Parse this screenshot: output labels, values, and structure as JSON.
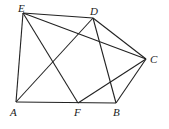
{
  "diagram": {
    "points": [
      {
        "name": "E",
        "x": 23,
        "y": 13,
        "label_x": 18,
        "label_y": 12
      },
      {
        "name": "D",
        "x": 93,
        "y": 18,
        "label_x": 90,
        "label_y": 15
      },
      {
        "name": "C",
        "x": 146,
        "y": 59,
        "label_x": 150,
        "label_y": 63
      },
      {
        "name": "B",
        "x": 116,
        "y": 103,
        "label_x": 113,
        "label_y": 116
      },
      {
        "name": "F",
        "x": 78,
        "y": 103,
        "label_x": 74,
        "label_y": 116
      },
      {
        "name": "A",
        "x": 16,
        "y": 102,
        "label_x": 10,
        "label_y": 116
      }
    ],
    "segments": [
      [
        "E",
        "D"
      ],
      [
        "E",
        "A"
      ],
      [
        "E",
        "F"
      ],
      [
        "E",
        "C"
      ],
      [
        "D",
        "A"
      ],
      [
        "D",
        "B"
      ],
      [
        "D",
        "C"
      ],
      [
        "C",
        "B"
      ],
      [
        "C",
        "F"
      ],
      [
        "A",
        "B"
      ]
    ]
  }
}
